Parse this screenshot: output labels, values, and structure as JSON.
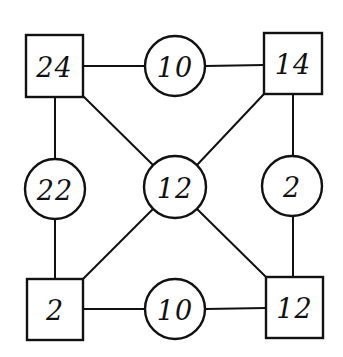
{
  "diagram": {
    "type": "magic-number-graph",
    "colors": {
      "stroke": "#111111",
      "fill": "#ffffff",
      "text": "#111111"
    },
    "nodes": [
      {
        "id": "sq-tl",
        "shape": "square",
        "label": "24",
        "x": 26,
        "y": 35,
        "w": 57,
        "h": 62
      },
      {
        "id": "sq-tr",
        "shape": "square",
        "label": "14",
        "x": 264,
        "y": 33,
        "w": 58,
        "h": 61
      },
      {
        "id": "sq-bl",
        "shape": "square",
        "label": "2",
        "x": 27,
        "y": 279,
        "w": 56,
        "h": 61
      },
      {
        "id": "sq-br",
        "shape": "square",
        "label": "12",
        "x": 266,
        "y": 277,
        "w": 57,
        "h": 61
      },
      {
        "id": "ci-top",
        "shape": "circle",
        "label": "10",
        "cx": 175,
        "cy": 66,
        "r": 30
      },
      {
        "id": "ci-left",
        "shape": "circle",
        "label": "22",
        "cx": 55,
        "cy": 189,
        "r": 30
      },
      {
        "id": "ci-center",
        "shape": "circle",
        "label": "12",
        "cx": 175,
        "cy": 187,
        "r": 31
      },
      {
        "id": "ci-right",
        "shape": "circle",
        "label": "2",
        "cx": 292,
        "cy": 186,
        "r": 30
      },
      {
        "id": "ci-bottom",
        "shape": "circle",
        "label": "10",
        "cx": 175,
        "cy": 309,
        "r": 30
      }
    ],
    "edges": [
      {
        "from": "sq-tl",
        "to": "ci-top",
        "x1": 83,
        "y1": 66,
        "x2": 145,
        "y2": 66
      },
      {
        "from": "ci-top",
        "to": "sq-tr",
        "x1": 205,
        "y1": 66,
        "x2": 264,
        "y2": 65
      },
      {
        "from": "sq-bl",
        "to": "ci-bottom",
        "x1": 83,
        "y1": 309,
        "x2": 145,
        "y2": 309
      },
      {
        "from": "ci-bottom",
        "to": "sq-br",
        "x1": 205,
        "y1": 309,
        "x2": 266,
        "y2": 308
      },
      {
        "from": "sq-tl",
        "to": "ci-left",
        "x1": 55,
        "y1": 97,
        "x2": 55,
        "y2": 159
      },
      {
        "from": "ci-left",
        "to": "sq-bl",
        "x1": 55,
        "y1": 219,
        "x2": 55,
        "y2": 279
      },
      {
        "from": "sq-tr",
        "to": "ci-right",
        "x1": 293,
        "y1": 94,
        "x2": 293,
        "y2": 156
      },
      {
        "from": "ci-right",
        "to": "sq-br",
        "x1": 293,
        "y1": 216,
        "x2": 293,
        "y2": 277
      },
      {
        "from": "sq-tl",
        "to": "ci-center",
        "x1": 83,
        "y1": 96,
        "x2": 153,
        "y2": 165
      },
      {
        "from": "sq-tr",
        "to": "ci-center",
        "x1": 264,
        "y1": 94,
        "x2": 197,
        "y2": 165
      },
      {
        "from": "sq-bl",
        "to": "ci-center",
        "x1": 83,
        "y1": 279,
        "x2": 153,
        "y2": 209
      },
      {
        "from": "sq-br",
        "to": "ci-center",
        "x1": 266,
        "y1": 277,
        "x2": 197,
        "y2": 209
      }
    ]
  }
}
